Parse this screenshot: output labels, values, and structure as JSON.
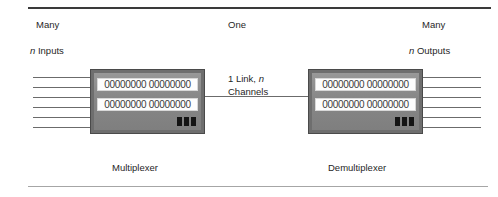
{
  "figure": {
    "labels": {
      "many_left": "Many",
      "inputs_italic": "n",
      "inputs_rest": " Inputs",
      "one": "One",
      "many_right": "Many",
      "outputs_italic": "n",
      "outputs_rest": " Outputs"
    },
    "link": {
      "line1_prefix": "1 Link, ",
      "line1_italic": "n",
      "line2": "Channels"
    },
    "captions": {
      "multiplexer": "Multiplexer",
      "demultiplexer": "Demultiplexer"
    },
    "devices": [
      {
        "name": "multiplexer",
        "display_top": "00000000 00000000",
        "display_bottom": "00000000 00000000",
        "indicator_count": 3
      },
      {
        "name": "demultiplexer",
        "display_top": "00000000 00000000",
        "display_bottom": "00000000 00000000",
        "indicator_count": 3
      }
    ],
    "wire_counts": {
      "inputs": 6,
      "outputs": 6,
      "link": 1
    },
    "colors": {
      "rule_top": "#3a3a3a",
      "rule_bottom": "#a6a6a6",
      "device_body": "#8c8c8c",
      "device_border": "#4a4a4a",
      "screen_bg": "#fdfdfd",
      "indicator": "#141414",
      "wire": "#6b6b6b",
      "text": "#1f1f1f"
    }
  }
}
